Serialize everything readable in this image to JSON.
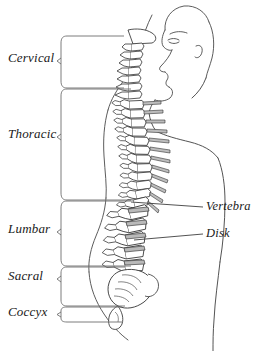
{
  "figure": {
    "view": "lateral profile, facing right",
    "line_color": "#333333",
    "hair_line_color": "#555555",
    "background": "#ffffff"
  },
  "region_labels": [
    {
      "id": "cervical",
      "text": "Cervical",
      "x": 8,
      "y": 58,
      "box": {
        "top": 36,
        "bottom": 88
      }
    },
    {
      "id": "thoracic",
      "text": "Thoracic",
      "x": 8,
      "y": 134,
      "box": {
        "top": 89,
        "bottom": 200
      }
    },
    {
      "id": "lumbar",
      "text": "Lumbar",
      "x": 8,
      "y": 228,
      "box": {
        "top": 201,
        "bottom": 266
      }
    },
    {
      "id": "sacral",
      "text": "Sacral",
      "x": 8,
      "y": 275,
      "box": {
        "top": 267,
        "bottom": 306
      }
    },
    {
      "id": "coccyx",
      "text": "Coccyx",
      "x": 8,
      "y": 311,
      "box": {
        "top": 307,
        "bottom": 322
      }
    }
  ],
  "part_labels": [
    {
      "id": "vertebra",
      "text": "Vertebra",
      "x": 206,
      "y": 207,
      "leader_from_x": 131,
      "leader_from_y": 202
    },
    {
      "id": "disk",
      "text": "Disk",
      "x": 206,
      "y": 234,
      "leader_from_x": 134,
      "leader_from_y": 240
    }
  ],
  "bracket": {
    "x_left": 60,
    "x_right": 131,
    "nub_depth": 6,
    "corner_radius": 7
  },
  "colors": {
    "ink": "#333333",
    "text": "#1a1a1a",
    "bone_fill": "#ffffff",
    "disk_fill": "#b9b9b9"
  }
}
